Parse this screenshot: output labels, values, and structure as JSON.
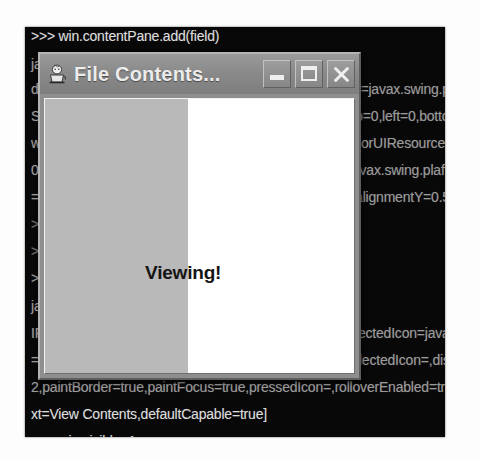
{
  "console": {
    "name": "jython-console",
    "background_color": "#080808",
    "text_color": "#dcdcdc",
    "lines": [
      {
        "text": ">>> win.contentPane.add(field)",
        "top": 2,
        "class": "console-line"
      },
      {
        "text": "javax.swing.JTextField[,0,0,0x0,invalid,layout=j",
        "top": 30,
        "class": "console-line dim"
      },
      {
        "text": "d.plaf.basic.BasicTextUI$BasicCaret,disabledTextColor=javax.swing.plaf.ColorUIResource$Com",
        "top": 55,
        "class": "console-line dim"
      },
      {
        "text": "Shadow,margin=javax.swing.plaf.InsetsUIResource[top=0,left=0,bottom=0,right=0],maximumSize=,minimumSize=,preferredHeight=2",
        "top": 82,
        "class": "console-line dim"
      },
      {
        "text": "w.WindowsTextFieldUI,caretColor=javax.swing.plaf.ColorUIResource[r=0,g=0,b=0],disabledTextColor=javax.swing.r=153,b=1",
        "top": 109,
        "class": "console-line dim"
      },
      {
        "text": "0,horizontalAlignment=LEADING,selectedTextColor=javax.swing.plaf.ColorUIResource[r=255,g=255,b=255],ColorU",
        "top": 136,
        "class": "console-line dim"
      },
      {
        "text": "=javax.swing.JButton[,0,0,0x0,invalid,alignmentX=0.0,alignmentY=0.5,border=,flags=296,maximumSize=,command=",
        "top": 163,
        "class": "console-line dim"
      },
      {
        "text": ">>> btn = swing.JButton(\"View Contents\")",
        "top": 190,
        "class": "console-line faint"
      },
      {
        "text": ">>> btn.actionPerformed = viewContents",
        "top": 217,
        "class": "console-line faint"
      },
      {
        "text": ">>> win.contentPane.add(btn)   # \"View Contents\",pr",
        "top": 244,
        "class": "console-line dim"
      },
      {
        "text": "javax.swing.JButton[,0,0,0x0,invalid,layout=jav",
        "top": 272,
        "class": "console-line dim"
      },
      {
        "text": "IFrame,rolloverEnabled=false,rolloverIcon=,rolloverSelectedIcon=javax.swing.ImageIcon@source@9",
        "top": 299,
        "class": "console-line dim"
      },
      {
        "text": "=,pressedIcon=,rolloverIcon=,rolloverSelectedIcon=,selectedIcon=,disabledIcon=,d",
        "top": 326,
        "class": "console-line dim"
      },
      {
        "text": "2,paintBorder=true,paintFocus=true,pressedIcon=,rolloverEnabled=true,focus=true,",
        "top": 353,
        "class": "console-line dim"
      },
      {
        "text": "xt=View Contents,defaultCapable=true]",
        "top": 380,
        "class": "console-line"
      },
      {
        "text": ">>> win.visible=1",
        "top": 407,
        "class": "console-line"
      }
    ]
  },
  "dialog": {
    "name": "file-contents-dialog",
    "title": "File Contents...",
    "icon": "java-duke-icon",
    "titlebar_color": "#8a8a8a",
    "buttons": {
      "minimize_label": "–",
      "maximize_label": "□",
      "close_label": "✕"
    },
    "content": {
      "label": "Viewing!",
      "left_panel_color": "#b9b9b9",
      "right_panel_color": "#ffffff"
    }
  }
}
